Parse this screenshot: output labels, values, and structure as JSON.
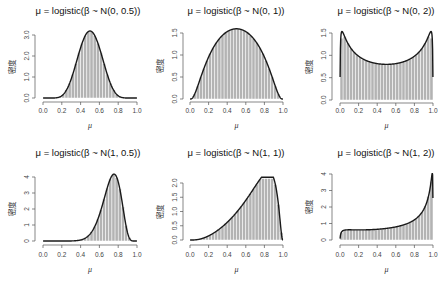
{
  "figure": {
    "layout": "2x3 grid of histograms with density curves",
    "ylabel": "密度",
    "xlabel": "μ"
  },
  "chart_data": [
    {
      "type": "bar+line",
      "title": "μ = logistic(β ~ N(0, 0.5))",
      "mean": 0,
      "sd": 0.5,
      "xlabel": "μ",
      "ylabel": "密度",
      "xlim": [
        0,
        1
      ],
      "ylim": [
        0,
        3.2
      ],
      "xticks": [
        "0.0",
        "0.2",
        "0.4",
        "0.6",
        "0.8",
        "1.0"
      ],
      "yticks": [
        "0.0",
        "1.0",
        "2.0",
        "3.0"
      ],
      "ytick_values": [
        0,
        1,
        2,
        3
      ],
      "peak": {
        "x": 0.5,
        "y": 3.19
      },
      "bins": 20
    },
    {
      "type": "bar+line",
      "title": "μ = logistic(β ~ N(0, 1))",
      "mean": 0,
      "sd": 1,
      "xlabel": "μ",
      "ylabel": "密度",
      "xlim": [
        0,
        1
      ],
      "ylim": [
        0,
        1.6
      ],
      "xticks": [
        "0.0",
        "0.2",
        "0.4",
        "0.6",
        "0.8",
        "1.0"
      ],
      "yticks": [
        "0.0",
        "0.5",
        "1.0",
        "1.5"
      ],
      "ytick_values": [
        0,
        0.5,
        1,
        1.5
      ],
      "peak": {
        "x": 0.5,
        "y": 1.6
      },
      "bins": 20
    },
    {
      "type": "bar+line",
      "title": "μ = logistic(β ~ N(0, 2))",
      "mean": 0,
      "sd": 2,
      "xlabel": "μ",
      "ylabel": "密度",
      "xlim": [
        0,
        1
      ],
      "ylim": [
        0,
        1.55
      ],
      "xticks": [
        "0.0",
        "0.2",
        "0.4",
        "0.6",
        "0.8",
        "1.0"
      ],
      "yticks": [
        "0.0",
        "0.5",
        "1.0",
        "1.5"
      ],
      "ytick_values": [
        0,
        0.5,
        1,
        1.5
      ],
      "peak": {
        "x": 0.02,
        "y": 1.55
      },
      "trough": {
        "x": 0.5,
        "y": 0.8
      },
      "bins": 20
    },
    {
      "type": "bar+line",
      "title": "μ = logistic(β ~ N(1, 0.5))",
      "mean": 1,
      "sd": 0.5,
      "xlabel": "μ",
      "ylabel": "密度",
      "xlim": [
        0,
        1
      ],
      "ylim": [
        0,
        4.2
      ],
      "xticks": [
        "0.0",
        "0.2",
        "0.4",
        "0.6",
        "0.8",
        "1.0"
      ],
      "yticks": [
        "0",
        "1",
        "2",
        "3",
        "4"
      ],
      "ytick_values": [
        0,
        1,
        2,
        3,
        4
      ],
      "peak": {
        "x": 0.75,
        "y": 4.2
      },
      "bins": 20
    },
    {
      "type": "bar+line",
      "title": "μ = logistic(β ~ N(1, 1))",
      "mean": 1,
      "sd": 1,
      "xlabel": "μ",
      "ylabel": "密度",
      "xlim": [
        0,
        1
      ],
      "ylim": [
        0,
        2.35
      ],
      "xticks": [
        "0.0",
        "0.2",
        "0.4",
        "0.6",
        "0.8",
        "1.0"
      ],
      "yticks": [
        "0.0",
        "0.5",
        "1.0",
        "1.5",
        "2.0"
      ],
      "ytick_values": [
        0,
        0.5,
        1,
        1.5,
        2
      ],
      "peak": {
        "x": 0.85,
        "y": 2.35
      },
      "bins": 20
    },
    {
      "type": "bar+line",
      "title": "μ = logistic(β ~ N(1, 2))",
      "mean": 1,
      "sd": 2,
      "xlabel": "μ",
      "ylabel": "密度",
      "xlim": [
        0,
        1
      ],
      "ylim": [
        0,
        4.1
      ],
      "xticks": [
        "0.0",
        "0.2",
        "0.4",
        "0.6",
        "0.8",
        "1.0"
      ],
      "yticks": [
        "0",
        "1",
        "2",
        "3",
        "4"
      ],
      "ytick_values": [
        0,
        1,
        2,
        3,
        4
      ],
      "peak": {
        "x": 0.99,
        "y": 4.1
      },
      "bins": 20
    }
  ],
  "panels_geometry": [
    {
      "x0": 43,
      "x1": 137,
      "y0": 98,
      "ytop": 35,
      "ytop_val": 3,
      "axis_y": 102,
      "yaxis_x": 35,
      "title_cx": 88,
      "title_y": 14,
      "ticklab_y": 113,
      "xlab_y": 128,
      "ylab_x": 15
    },
    {
      "x0": 190,
      "x1": 283,
      "y0": 99,
      "ytop": 33,
      "ytop_val": 1.5,
      "axis_y": 102,
      "yaxis_x": 183,
      "title_cx": 236,
      "title_y": 14,
      "ticklab_y": 113,
      "xlab_y": 128,
      "ylab_x": 163
    },
    {
      "x0": 340,
      "x1": 433,
      "y0": 100,
      "ytop": 33,
      "ytop_val": 1.5,
      "axis_y": 103,
      "yaxis_x": 332,
      "title_cx": 386,
      "title_y": 14,
      "ticklab_y": 113,
      "xlab_y": 128,
      "ylab_x": 312
    },
    {
      "x0": 43,
      "x1": 137,
      "y0": 241,
      "ytop": 177,
      "ytop_val": 4,
      "axis_y": 245,
      "yaxis_x": 35,
      "title_cx": 88,
      "title_y": 156,
      "ticklab_y": 257,
      "xlab_y": 272,
      "ylab_x": 15
    },
    {
      "x0": 190,
      "x1": 283,
      "y0": 240,
      "ytop": 183,
      "ytop_val": 2,
      "axis_y": 245,
      "yaxis_x": 183,
      "title_cx": 236,
      "title_y": 156,
      "ticklab_y": 257,
      "xlab_y": 272,
      "ylab_x": 163
    },
    {
      "x0": 340,
      "x1": 433,
      "y0": 240,
      "ytop": 174,
      "ytop_val": 4,
      "axis_y": 245,
      "yaxis_x": 332,
      "title_cx": 386,
      "title_y": 156,
      "ticklab_y": 257,
      "xlab_y": 272,
      "ylab_x": 312
    }
  ],
  "colors": {
    "bar_fill": "#b3b3b3",
    "bar_stroke": "#ffffff",
    "curve": "#1a1a1a",
    "axis": "#555555"
  }
}
